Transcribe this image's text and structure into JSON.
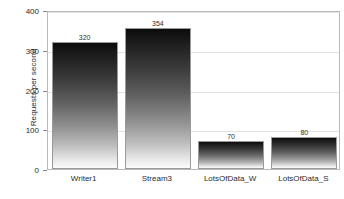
{
  "chart_data": {
    "type": "bar",
    "title": "",
    "subtitle": "",
    "xlabel": "",
    "ylabel": "Requests per second",
    "categories": [
      "Writer1",
      "Stream3",
      "LotsOfData_W",
      "LotsOfData_S"
    ],
    "values": [
      320,
      354,
      70,
      80
    ],
    "value_labels": [
      "320",
      "354",
      "70",
      "80"
    ],
    "ylim": [
      0,
      400
    ],
    "yticks": [
      0,
      100,
      200,
      300,
      400
    ],
    "ytick_labels": [
      "0",
      "100",
      "200",
      "300",
      "400"
    ],
    "grid": true,
    "grid_axis": "y",
    "legend": false,
    "legend_position": "none",
    "series": [
      {
        "name": "Requests per second",
        "values": [
          320,
          354,
          70,
          80
        ]
      }
    ],
    "colors": {
      "bar_top": "#0c0c0c",
      "bar_bottom": "#fbfbfb",
      "bar_border": "#9a9a9a",
      "gridline": "#e2e2e2",
      "frame": "#b9b9b9",
      "text": "#2b2b2b",
      "background": "#ffffff"
    }
  }
}
